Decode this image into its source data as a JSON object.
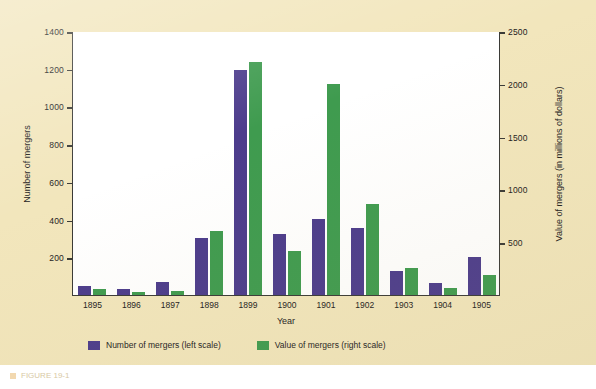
{
  "chart_data": {
    "type": "bar",
    "title": "",
    "subtitle": "",
    "xlabel": "Year",
    "ylabel": "Number of mergers",
    "ylabel_right": "Value of mergers (in millions of dollars)",
    "categories": [
      "1895",
      "1896",
      "1897",
      "1898",
      "1899",
      "1900",
      "1901",
      "1902",
      "1903",
      "1904",
      "1905"
    ],
    "series": [
      {
        "name": "Number of mergers (left scale)",
        "axis": "left",
        "color": "#4c3c8c",
        "values": [
          50,
          30,
          70,
          300,
          1195,
          325,
          405,
          355,
          125,
          65,
          200
        ]
      },
      {
        "name": "Value of mergers (right scale)",
        "axis": "right",
        "color": "#3f9b4f",
        "values": [
          55,
          25,
          40,
          605,
          2205,
          415,
          2000,
          865,
          255,
          70,
          185
        ]
      }
    ],
    "ylim": [
      0,
      1400
    ],
    "ylim_right": [
      0,
      2500
    ],
    "yticks": [
      0,
      200,
      400,
      600,
      800,
      1000,
      1200,
      1400
    ],
    "ytick_labels": [
      "",
      "200",
      "400",
      "600",
      "800",
      "1000",
      "1200",
      "1400"
    ],
    "yticks_right": [
      0,
      500,
      1000,
      1500,
      2000,
      2500
    ],
    "ytick_labels_right": [
      "",
      "500",
      "1000",
      "1500",
      "2000",
      "2500"
    ],
    "grid": false,
    "legend_position": "bottom"
  },
  "legend": {
    "items": [
      {
        "label": "Number of mergers (left scale)",
        "color": "#4c3c8c"
      },
      {
        "label": "Value of mergers (right scale)",
        "color": "#3f9b4f"
      }
    ]
  },
  "caption": {
    "text": "FIGURE 19-1"
  },
  "colors": {
    "background": "#f2e6bc",
    "plot_background": "#ffffff",
    "axis": "#3a3a36",
    "purple": "#4c3c8c",
    "green": "#3f9b4f"
  }
}
